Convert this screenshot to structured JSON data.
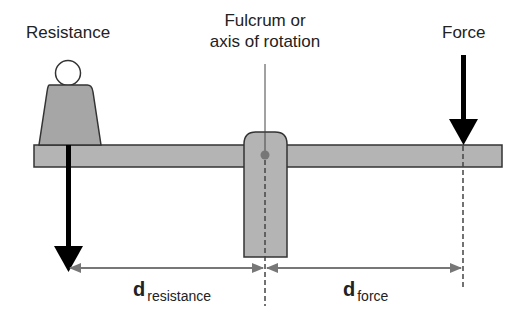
{
  "labels": {
    "resistance": "Resistance",
    "fulcrum_line1": "Fulcrum or",
    "fulcrum_line2": "axis of rotation",
    "force": "Force"
  },
  "distances": {
    "resistance": {
      "symbol": "d",
      "subscript": "resistance"
    },
    "force": {
      "symbol": "d",
      "subscript": "force"
    }
  },
  "colors": {
    "beam_fill": "#b4b4b4",
    "outline": "#333333",
    "arrow": "#000000",
    "dimension": "#777777",
    "pivot": "#777777"
  }
}
